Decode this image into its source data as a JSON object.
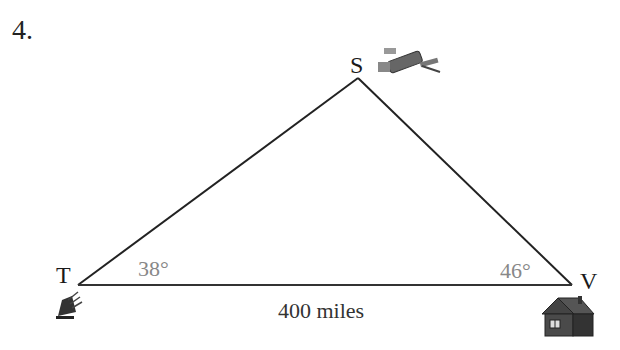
{
  "problem_number": "4.",
  "vertices": {
    "S": {
      "label": "S",
      "icon": "satellite-icon"
    },
    "T": {
      "label": "T",
      "icon": "satellite-dish-icon"
    },
    "V": {
      "label": "V",
      "icon": "house-icon"
    }
  },
  "angles": {
    "T": "38°",
    "V": "46°"
  },
  "base_length": "400 miles",
  "colors": {
    "line": "#222222",
    "angle_text": "#888888"
  }
}
